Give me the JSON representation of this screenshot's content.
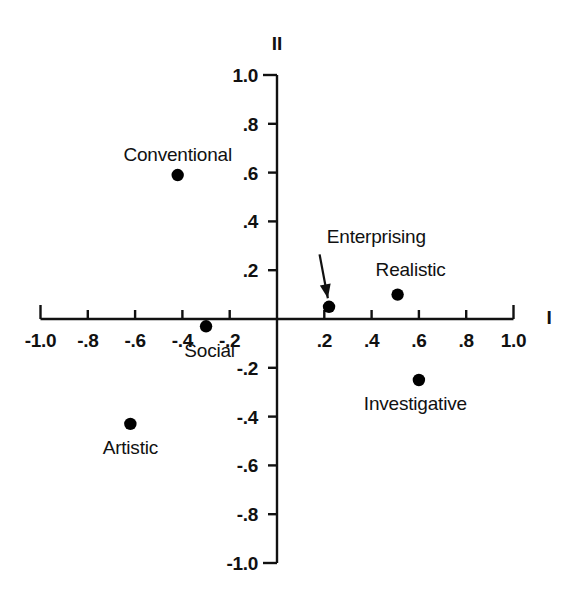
{
  "chart_data": {
    "type": "scatter",
    "title": "",
    "xlabel": "I",
    "ylabel": "II",
    "xlim": [
      -1.0,
      1.0
    ],
    "ylim": [
      -1.0,
      1.0
    ],
    "grid": false,
    "legend": "none",
    "xticks": [
      -1.0,
      -0.8,
      -0.6,
      -0.4,
      -0.2,
      0.2,
      0.4,
      0.6,
      0.8,
      1.0
    ],
    "xtick_labels": [
      "-1.0",
      "-.8",
      "-.6",
      "-.4",
      "-.2",
      ".2",
      ".4",
      ".6",
      ".8",
      "1.0"
    ],
    "yticks": [
      1.0,
      0.8,
      0.6,
      0.4,
      0.2,
      -0.2,
      -0.4,
      -0.6,
      -0.8,
      -1.0
    ],
    "ytick_labels": [
      "1.0",
      ".8",
      ".6",
      ".4",
      ".2",
      "-.2",
      "-.4",
      "-.6",
      "-.8",
      "-1.0"
    ],
    "points": [
      {
        "name": "Conventional",
        "x": -0.42,
        "y": 0.59,
        "label_dx": 0,
        "label_dy": 0.085,
        "label_anchor": "mid"
      },
      {
        "name": "Social",
        "x": -0.3,
        "y": -0.03,
        "label_dx": 0.015,
        "label_dy": -0.095,
        "label_anchor": "mid"
      },
      {
        "name": "Enterprising",
        "x": 0.22,
        "y": 0.05,
        "label_dx": 0.2,
        "label_dy": 0.29,
        "label_anchor": "mid"
      },
      {
        "name": "Realistic",
        "x": 0.51,
        "y": 0.1,
        "label_dx": 0.055,
        "label_dy": 0.105,
        "label_anchor": "mid"
      },
      {
        "name": "Investigative",
        "x": 0.6,
        "y": -0.25,
        "label_dx": -0.015,
        "label_dy": -0.095,
        "label_anchor": "mid"
      },
      {
        "name": "Artistic",
        "x": -0.62,
        "y": -0.43,
        "label_dx": 0,
        "label_dy": -0.095,
        "label_anchor": "mid"
      }
    ],
    "annotations": [
      {
        "text": "Enterprising",
        "arrow_from": {
          "x": 0.18,
          "y": 0.265
        },
        "arrow_to": {
          "x": 0.215,
          "y": 0.085
        }
      }
    ]
  },
  "labels": {
    "axis_x": "I",
    "axis_y": "II",
    "conventional": "Conventional",
    "social": "Social",
    "enterprising": "Enterprising",
    "realistic": "Realistic",
    "investigative": "Investigative",
    "artistic": "Artistic"
  },
  "style": {
    "axis_color": "#111111",
    "point_color": "#000000",
    "background": "#ffffff"
  }
}
